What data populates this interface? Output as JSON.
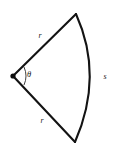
{
  "figure": {
    "name": "circular-sector",
    "background_color": "#ffffff",
    "stroke_color": "#131313",
    "labels": {
      "radius_top": "r",
      "radius_bottom": "r",
      "arc_length": "s",
      "angle": "θ"
    },
    "geometry": {
      "vertex": {
        "x": 13,
        "y": 76
      },
      "top_endpoint": {
        "x": 76,
        "y": 14
      },
      "bottom_endpoint": {
        "x": 75,
        "y": 142
      },
      "arc_outer_x": 100,
      "label_positions": {
        "radius_top": {
          "x": 40,
          "y": 36
        },
        "radius_bottom": {
          "x": 42,
          "y": 121
        },
        "arc_length": {
          "x": 105,
          "y": 77
        },
        "angle": {
          "x": 29,
          "y": 75
        }
      }
    }
  }
}
